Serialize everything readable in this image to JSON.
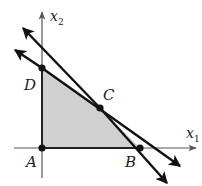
{
  "diagram": {
    "type": "linear-programming-feasible-region",
    "colors": {
      "region_fill": "#d0d0d0",
      "line": "#111111",
      "axis": "#555555",
      "point": "#111111"
    },
    "axes": {
      "x": {
        "label": "x",
        "subscript": "1"
      },
      "y": {
        "label": "x",
        "subscript": "2"
      }
    },
    "points": [
      {
        "id": "A",
        "label": "A"
      },
      {
        "id": "B",
        "label": "B"
      },
      {
        "id": "C",
        "label": "C"
      },
      {
        "id": "D",
        "label": "D"
      }
    ],
    "lines": [
      {
        "id": "line-DC",
        "through": [
          "D",
          "C"
        ]
      },
      {
        "id": "line-CB",
        "through": [
          "C",
          "B"
        ]
      }
    ],
    "feasible_region": [
      "A",
      "B",
      "C",
      "D"
    ]
  }
}
